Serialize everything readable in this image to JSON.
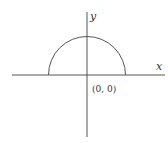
{
  "diagram": {
    "axes": {
      "x_label": "x",
      "y_label": "y",
      "origin_label": "(0, 0)"
    },
    "shape": {
      "type": "semicircle",
      "description": "upper half circle centered at origin"
    },
    "colors": {
      "stroke": "#555555",
      "text": "#333333",
      "background": "#ffffff"
    }
  }
}
